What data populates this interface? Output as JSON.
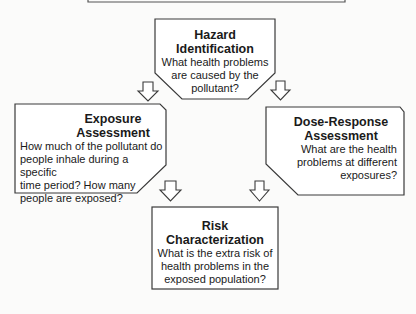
{
  "diagram": {
    "hazard": {
      "title_line1": "Hazard",
      "title_line2": "Identification",
      "body_line1": "What health problems",
      "body_line2": "are caused by the",
      "body_line3": "pollutant?"
    },
    "exposure": {
      "title_line1": "Exposure",
      "title_line2": "Assessment",
      "body_line1": "How much of the pollutant do",
      "body_line2": "people inhale during a specific",
      "body_line3": "time period? How many",
      "body_line4": "people are exposed?"
    },
    "dose_response": {
      "title_line1": "Dose-Response",
      "title_line2": "Assessment",
      "body_line1": "What are the health",
      "body_line2": "problems at different",
      "body_line3": "exposures?"
    },
    "risk": {
      "title_line1": "Risk",
      "title_line2": "Characterization",
      "body_line1": "What is the extra risk of",
      "body_line2": "health problems in the",
      "body_line3": "exposed population?"
    },
    "colors": {
      "stroke": "#3a3a3a",
      "fill": "#ffffff",
      "background": "#fbfbfa"
    }
  }
}
